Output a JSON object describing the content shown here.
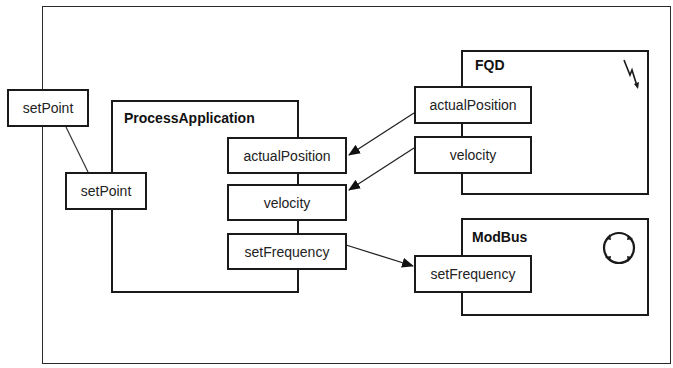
{
  "diagram": {
    "external_port": {
      "label": "setPoint"
    },
    "components": [
      {
        "name": "ProcessApplication",
        "ports": [
          {
            "label": "setPoint",
            "side": "left"
          },
          {
            "label": "actualPosition",
            "side": "right"
          },
          {
            "label": "velocity",
            "side": "right"
          },
          {
            "label": "setFrequency",
            "side": "right"
          }
        ]
      },
      {
        "name": "FQD",
        "icon": "lightning-icon",
        "ports": [
          {
            "label": "actualPosition",
            "side": "left"
          },
          {
            "label": "velocity",
            "side": "left"
          }
        ]
      },
      {
        "name": "ModBus",
        "icon": "cycle-icon",
        "ports": [
          {
            "label": "setFrequency",
            "side": "left"
          }
        ]
      }
    ],
    "connections": [
      {
        "from": "setPoint (external)",
        "to": "ProcessApplication.setPoint",
        "arrow": false
      },
      {
        "from": "FQD.actualPosition",
        "to": "ProcessApplication.actualPosition",
        "arrow": true
      },
      {
        "from": "FQD.velocity",
        "to": "ProcessApplication.velocity",
        "arrow": true
      },
      {
        "from": "ProcessApplication.setFrequency",
        "to": "ModBus.setFrequency",
        "arrow": true
      }
    ]
  }
}
